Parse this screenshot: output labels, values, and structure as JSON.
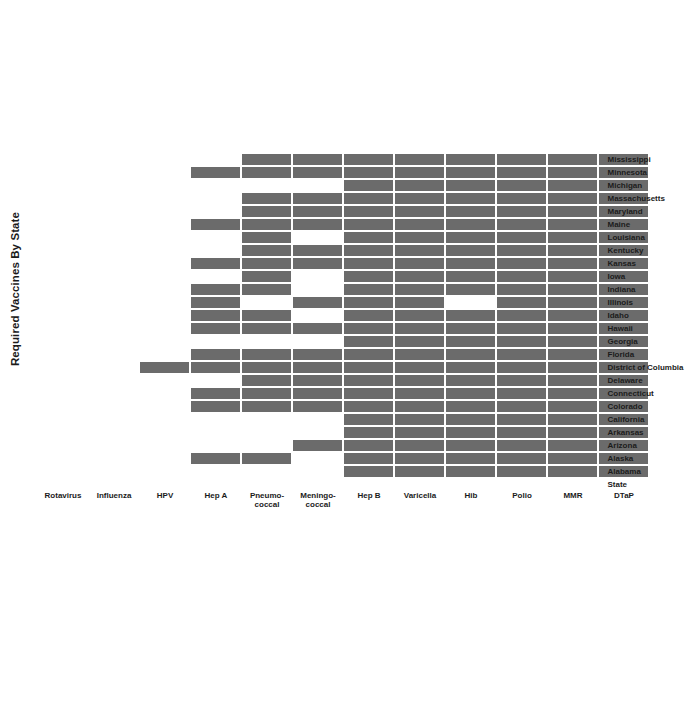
{
  "chart": {
    "title": "Required Vaccines By State",
    "row_axis_title": "State",
    "fill_color": "#6b6b6b",
    "empty_color": "#ffffff",
    "grid_line_color": "#ffffff",
    "background_color": "#ffffff"
  },
  "chart_data": {
    "type": "heatmap",
    "title": "Required Vaccines By State",
    "xlabel": "State",
    "ylabel": "",
    "grid": true,
    "legend": "none",
    "orientation": "rotated-90-ccw",
    "value_meaning": {
      "1": "required",
      "0": "not required"
    },
    "columns": [
      "DTaP",
      "MMR",
      "Polio",
      "Hib",
      "Varicella",
      "Hep B",
      "Meningo-\ncoccal",
      "Pneumo-\ncoccal",
      "Hep A",
      "HPV",
      "Influenza",
      "Rotavirus"
    ],
    "column_labels_display": [
      "DTaP",
      "MMR",
      "Polio",
      "Hib",
      "Varicella",
      "Hep B",
      "Meningo- coccal",
      "Pneumo- coccal",
      "Hep A",
      "HPV",
      "Influenza",
      "Rotavirus"
    ],
    "categories": [
      "Alabama",
      "Alaska",
      "Arizona",
      "Arkansas",
      "California",
      "Colorado",
      "Connecticut",
      "Delaware",
      "District of Columbia",
      "Florida",
      "Georgia",
      "Hawaii",
      "Idaho",
      "Illinois",
      "Indiana",
      "Iowa",
      "Kansas",
      "Kentucky",
      "Louisiana",
      "Maine",
      "Maryland",
      "Massachusetts",
      "Michigan",
      "Minnesota",
      "Mississippi"
    ],
    "rows": [
      {
        "state": "Alabama",
        "values": [
          1,
          1,
          1,
          1,
          1,
          1,
          0,
          0,
          0,
          0,
          0,
          0
        ]
      },
      {
        "state": "Alaska",
        "values": [
          1,
          1,
          1,
          1,
          1,
          1,
          0,
          1,
          1,
          0,
          0,
          0
        ]
      },
      {
        "state": "Arizona",
        "values": [
          1,
          1,
          1,
          1,
          1,
          1,
          1,
          0,
          0,
          0,
          0,
          0
        ]
      },
      {
        "state": "Arkansas",
        "values": [
          1,
          1,
          1,
          1,
          1,
          1,
          0,
          0,
          0,
          0,
          0,
          0
        ]
      },
      {
        "state": "California",
        "values": [
          1,
          1,
          1,
          1,
          1,
          1,
          0,
          0,
          0,
          0,
          0,
          0
        ]
      },
      {
        "state": "Colorado",
        "values": [
          1,
          1,
          1,
          1,
          1,
          1,
          1,
          1,
          1,
          0,
          0,
          0
        ]
      },
      {
        "state": "Connecticut",
        "values": [
          1,
          1,
          1,
          1,
          1,
          1,
          1,
          1,
          1,
          0,
          0,
          0
        ]
      },
      {
        "state": "Delaware",
        "values": [
          1,
          1,
          1,
          1,
          1,
          1,
          1,
          1,
          0,
          0,
          0,
          0
        ]
      },
      {
        "state": "District of Columbia",
        "values": [
          1,
          1,
          1,
          1,
          1,
          1,
          1,
          1,
          1,
          1,
          0,
          0
        ]
      },
      {
        "state": "Florida",
        "values": [
          1,
          1,
          1,
          1,
          1,
          1,
          1,
          1,
          1,
          0,
          0,
          0
        ]
      },
      {
        "state": "Georgia",
        "values": [
          1,
          1,
          1,
          1,
          1,
          1,
          0,
          0,
          0,
          0,
          0,
          0
        ]
      },
      {
        "state": "Hawaii",
        "values": [
          1,
          1,
          1,
          1,
          1,
          1,
          1,
          1,
          1,
          0,
          0,
          0
        ]
      },
      {
        "state": "Idaho",
        "values": [
          1,
          1,
          1,
          1,
          1,
          1,
          0,
          1,
          1,
          0,
          0,
          0
        ]
      },
      {
        "state": "Illinois",
        "values": [
          1,
          1,
          1,
          0,
          1,
          1,
          1,
          0,
          1,
          0,
          0,
          0
        ]
      },
      {
        "state": "Indiana",
        "values": [
          1,
          1,
          1,
          1,
          1,
          1,
          0,
          1,
          1,
          0,
          0,
          0
        ]
      },
      {
        "state": "Iowa",
        "values": [
          1,
          1,
          1,
          1,
          1,
          1,
          0,
          1,
          0,
          0,
          0,
          0
        ]
      },
      {
        "state": "Kansas",
        "values": [
          1,
          1,
          1,
          1,
          1,
          1,
          1,
          1,
          1,
          0,
          0,
          0
        ]
      },
      {
        "state": "Kentucky",
        "values": [
          1,
          1,
          1,
          1,
          1,
          1,
          1,
          1,
          0,
          0,
          0,
          0
        ]
      },
      {
        "state": "Louisiana",
        "values": [
          1,
          1,
          1,
          1,
          1,
          1,
          0,
          1,
          0,
          0,
          0,
          0
        ]
      },
      {
        "state": "Maine",
        "values": [
          1,
          1,
          1,
          1,
          1,
          1,
          1,
          1,
          1,
          0,
          0,
          0
        ]
      },
      {
        "state": "Maryland",
        "values": [
          1,
          1,
          1,
          1,
          1,
          1,
          1,
          1,
          0,
          0,
          0,
          0
        ]
      },
      {
        "state": "Massachusetts",
        "values": [
          1,
          1,
          1,
          1,
          1,
          1,
          1,
          1,
          0,
          0,
          0,
          0
        ]
      },
      {
        "state": "Michigan",
        "values": [
          1,
          1,
          1,
          1,
          1,
          1,
          0,
          0,
          0,
          0,
          0,
          0
        ]
      },
      {
        "state": "Minnesota",
        "values": [
          1,
          1,
          1,
          1,
          1,
          1,
          1,
          1,
          1,
          0,
          0,
          0
        ]
      },
      {
        "state": "Mississippi",
        "values": [
          1,
          1,
          1,
          1,
          1,
          1,
          1,
          1,
          0,
          0,
          0,
          0
        ]
      }
    ]
  },
  "layout": {
    "cell_w": 13.0,
    "cell_h": 51.0,
    "gap": 1.4
  }
}
